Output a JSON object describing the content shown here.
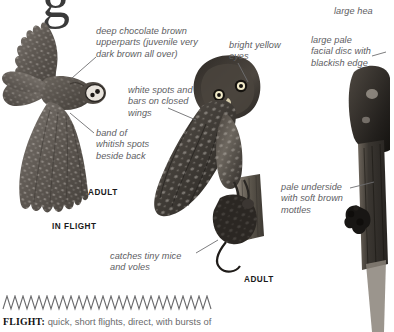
{
  "page": {
    "title_fragment": "g",
    "background": "#ffffff",
    "text_color": "#5d5d5f",
    "label_color": "#1a1a1a"
  },
  "annotations": [
    {
      "id": "upperparts",
      "text": "deep chocolate brown\nupperparts (juvenile very\ndark brown all over)",
      "x": 96,
      "y": 26,
      "width": 112
    },
    {
      "id": "bright-eyes",
      "text": "bright yellow\neyes",
      "x": 229,
      "y": 40,
      "width": 70
    },
    {
      "id": "large-head",
      "text": "large hea",
      "x": 334,
      "y": 6,
      "width": 60
    },
    {
      "id": "facial-disc",
      "text": "large pale\nfacial disc with\nblackish edge",
      "x": 311,
      "y": 35,
      "width": 80
    },
    {
      "id": "white-spots",
      "text": "white spots and\nbars on closed\nwings",
      "x": 128,
      "y": 85,
      "width": 80
    },
    {
      "id": "band-whitish",
      "text": "band of\nwhitish spots\nbeside back",
      "x": 96,
      "y": 128,
      "width": 72
    },
    {
      "id": "pale-underside",
      "text": "pale underside\nwith soft brown\nmottles",
      "x": 281,
      "y": 182,
      "width": 86
    },
    {
      "id": "catches-mice",
      "text": "catches tiny mice\nand voles",
      "x": 110,
      "y": 251,
      "width": 92
    }
  ],
  "labels": [
    {
      "id": "adult-flight",
      "text": "ADULT",
      "x": 88,
      "y": 188
    },
    {
      "id": "in-flight",
      "text": "IN FLIGHT",
      "x": 52,
      "y": 222
    },
    {
      "id": "adult-perched",
      "text": "ADULT",
      "x": 244,
      "y": 275
    }
  ],
  "flight_note": {
    "label": "FLIGHT:",
    "text": " quick, short flights, direct, with bursts of"
  },
  "illustrations": [
    {
      "id": "owl-in-flight",
      "name": "owl-in-flight-illustration"
    },
    {
      "id": "owl-perched-with-prey",
      "name": "owl-perched-illustration"
    },
    {
      "id": "owl-on-stump",
      "name": "owl-on-stump-illustration"
    }
  ]
}
